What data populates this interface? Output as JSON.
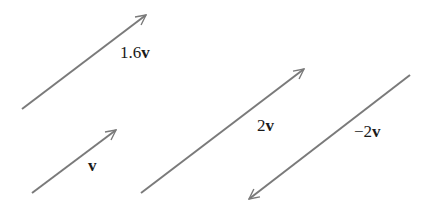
{
  "diagram": {
    "title": "",
    "line_color": "#7a7a7a",
    "text_color": "#1a1a1a",
    "vectors": [
      {
        "id": "v1_6",
        "label_coef": "1.6",
        "label_vec": "v",
        "x1": 22,
        "y1": 109,
        "x2": 146,
        "y2": 15,
        "label_x": 120,
        "label_y": 44
      },
      {
        "id": "v",
        "label_coef": "",
        "label_vec": "v",
        "x1": 32,
        "y1": 193,
        "x2": 116,
        "y2": 130,
        "label_x": 88,
        "label_y": 157
      },
      {
        "id": "v2",
        "label_coef": "2",
        "label_vec": "v",
        "x1": 141,
        "y1": 193,
        "x2": 304,
        "y2": 69,
        "label_x": 257,
        "label_y": 117
      },
      {
        "id": "vneg2",
        "label_coef": "−2",
        "label_vec": "v",
        "x1": 410,
        "y1": 75,
        "x2": 249,
        "y2": 199,
        "label_x": 354,
        "label_y": 123
      }
    ]
  }
}
